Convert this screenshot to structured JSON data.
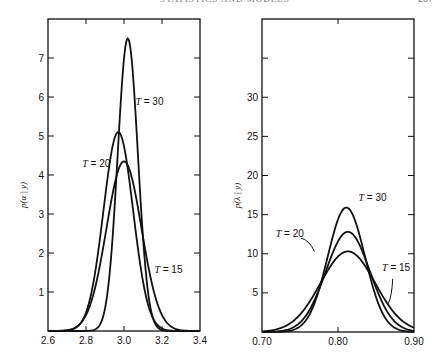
{
  "page": {
    "running_header": "STATISTICS AND MODELS",
    "page_number": "207"
  },
  "chart_data": [
    {
      "type": "line",
      "title": "",
      "xlabel": "",
      "ylabel": "p(α | y)",
      "xlim": [
        2.6,
        3.4
      ],
      "ylim": [
        0,
        8
      ],
      "x_ticks": [
        2.6,
        2.8,
        3.0,
        3.2,
        3.4
      ],
      "x_tick_labels": [
        "2.6",
        "2.8",
        "3.0",
        "3.2",
        "3.4"
      ],
      "y_ticks": [
        1,
        2,
        3,
        4,
        5,
        6,
        7
      ],
      "y_tick_labels": [
        "1",
        "2",
        "3",
        "4",
        "5",
        "6",
        "7"
      ],
      "grid": false,
      "legend": "inline annotations",
      "series": [
        {
          "name": "T = 30",
          "peak_x": 3.02,
          "peak_y": 7.5,
          "sd": 0.053
        },
        {
          "name": "T = 20",
          "peak_x": 2.97,
          "peak_y": 5.1,
          "sd": 0.078
        },
        {
          "name": "T = 15",
          "peak_x": 3.0,
          "peak_y": 4.35,
          "sd": 0.092
        }
      ],
      "annotations": [
        {
          "text": "T = 30",
          "x": 3.06,
          "y": 5.8
        },
        {
          "text": "T = 20",
          "x": 2.78,
          "y": 4.2
        },
        {
          "text": "T = 15",
          "x": 3.16,
          "y": 1.5
        }
      ]
    },
    {
      "type": "line",
      "title": "",
      "xlabel": "",
      "ylabel": "p(λ | y)",
      "xlim": [
        0.7,
        0.9
      ],
      "ylim": [
        0,
        40
      ],
      "x_ticks": [
        0.7,
        0.8,
        0.9
      ],
      "x_tick_labels": [
        "0.70",
        "0.80",
        "0.90"
      ],
      "y_ticks": [
        5,
        10,
        15,
        20,
        25,
        30,
        35
      ],
      "y_tick_labels": [
        "5",
        "10",
        "15",
        "20",
        "25",
        "30",
        ""
      ],
      "grid": false,
      "legend": "inline annotations",
      "series": [
        {
          "name": "T = 30",
          "peak_x": 0.811,
          "peak_y": 15.9,
          "sd": 0.0245
        },
        {
          "name": "T = 20",
          "peak_x": 0.813,
          "peak_y": 12.8,
          "sd": 0.029
        },
        {
          "name": "T = 15",
          "peak_x": 0.813,
          "peak_y": 10.3,
          "sd": 0.036
        }
      ],
      "annotations": [
        {
          "text": "T = 30",
          "x": 0.827,
          "y": 16.7
        },
        {
          "text": "T = 20",
          "x": 0.718,
          "y": 12.2
        },
        {
          "text": "T = 15",
          "x": 0.858,
          "y": 7.8
        }
      ]
    }
  ],
  "panels": [
    {
      "box": {
        "x0": 48,
        "x1": 200,
        "y_top": 19,
        "y_bottom": 331
      }
    },
    {
      "box": {
        "x0": 262,
        "x1": 414,
        "y_top": 19,
        "y_bottom": 332
      }
    }
  ]
}
